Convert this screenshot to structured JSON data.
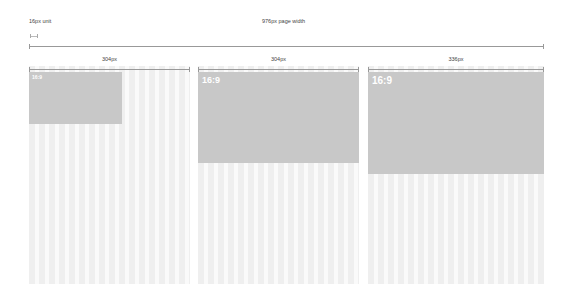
{
  "header": {
    "unit_label": "16px unit",
    "page_width_label": "976px page width"
  },
  "columns": [
    {
      "width_label": "304px",
      "box_label": "16:9"
    },
    {
      "width_label": "304px",
      "box_label": "16:9"
    },
    {
      "width_label": "336px",
      "box_label": "16:9"
    }
  ],
  "colors": {
    "box_fill": "#c8c8c8",
    "column_stripe_dark": "#efefef",
    "column_stripe_light": "#fafafa",
    "ruler": "#999999"
  }
}
